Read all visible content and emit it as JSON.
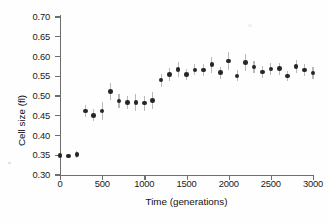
{
  "figure": {
    "name": "cell-size-vs-generations-scatter"
  },
  "chart_data": {
    "type": "scatter",
    "title": "",
    "xlabel": "Time (generations)",
    "ylabel": "Cell size (fl)",
    "xlim": [
      0,
      3000
    ],
    "ylim": [
      0.3,
      0.7
    ],
    "grid": false,
    "legend": false,
    "xticks": [
      0,
      500,
      1000,
      1500,
      2000,
      2500,
      3000
    ],
    "xtick_labels": [
      "0",
      "500",
      "1000",
      "1500",
      "2000",
      "2500",
      "3000"
    ],
    "yticks": [
      0.3,
      0.35,
      0.4,
      0.45,
      0.5,
      0.55,
      0.6,
      0.65,
      0.7
    ],
    "ytick_labels": [
      "0.30",
      "0.35",
      "0.40",
      "0.45",
      "0.50",
      "0.55",
      "0.60",
      "0.65",
      "0.70"
    ],
    "marker": "filled-circle",
    "marker_color": "#262626",
    "errorbar_color": "#b9b9b9",
    "x": [
      0,
      100,
      200,
      300,
      400,
      500,
      600,
      700,
      800,
      900,
      1000,
      1100,
      1200,
      1300,
      1400,
      1500,
      1600,
      1700,
      1800,
      1900,
      2000,
      2100,
      2200,
      2300,
      2400,
      2500,
      2600,
      2700,
      2800,
      2900,
      3000
    ],
    "y": [
      0.35,
      0.348,
      0.352,
      0.462,
      0.451,
      0.462,
      0.512,
      0.487,
      0.483,
      0.483,
      0.482,
      0.488,
      0.54,
      0.554,
      0.567,
      0.555,
      0.566,
      0.566,
      0.579,
      0.559,
      0.589,
      0.551,
      0.585,
      0.573,
      0.561,
      0.568,
      0.569,
      0.551,
      0.574,
      0.566,
      0.558
    ],
    "yerr": [
      0.004,
      0.006,
      0.01,
      0.016,
      0.015,
      0.024,
      0.022,
      0.018,
      0.017,
      0.021,
      0.019,
      0.021,
      0.016,
      0.017,
      0.018,
      0.014,
      0.014,
      0.015,
      0.02,
      0.015,
      0.022,
      0.014,
      0.021,
      0.016,
      0.015,
      0.015,
      0.015,
      0.013,
      0.016,
      0.015,
      0.016
    ]
  }
}
